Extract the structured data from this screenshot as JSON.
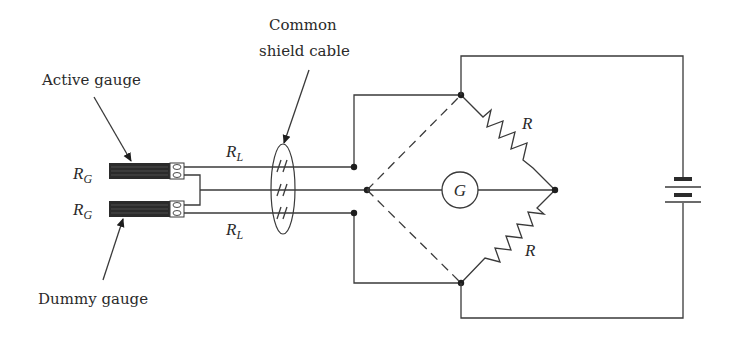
{
  "labels": {
    "active_gauge": "Active gauge",
    "dummy_gauge": "Dummy gauge",
    "cable_line1": "Common",
    "cable_line2": "shield cable",
    "rg_top": "R",
    "rg_top_sub": "G",
    "rg_bottom": "R",
    "rg_bottom_sub": "G",
    "rl_top": "R",
    "rl_top_sub": "L",
    "rl_bottom": "R",
    "rl_bottom_sub": "L",
    "r_top": "R",
    "r_bottom": "R",
    "galvanometer": "G"
  },
  "colors": {
    "line": "#3a3a3a",
    "gauge_fill": "#2b2b2b",
    "background": "#ffffff"
  },
  "components": [
    {
      "id": "active-gauge",
      "type": "strain-gauge",
      "label": "R_G"
    },
    {
      "id": "dummy-gauge",
      "type": "strain-gauge",
      "label": "R_G"
    },
    {
      "id": "shield-cable",
      "type": "cable",
      "conductors": 3
    },
    {
      "id": "bridge-resistor-top",
      "type": "resistor",
      "label": "R"
    },
    {
      "id": "bridge-resistor-bottom",
      "type": "resistor",
      "label": "R"
    },
    {
      "id": "galvanometer",
      "type": "meter",
      "label": "G"
    },
    {
      "id": "battery",
      "type": "battery"
    }
  ]
}
